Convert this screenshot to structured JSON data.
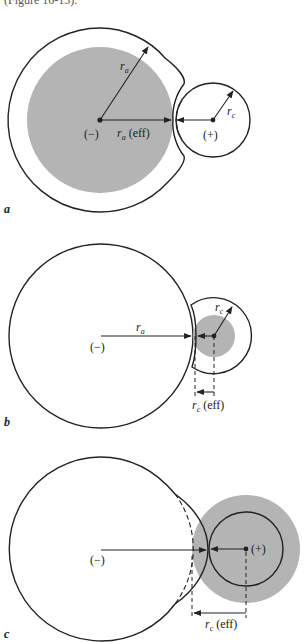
{
  "header": {
    "cut_text": "(Figure 16-13)."
  },
  "colors": {
    "shade": "#b4b4b4",
    "stroke": "#222222",
    "background": "#ffffff"
  },
  "panels": [
    {
      "id": "a",
      "label": "a",
      "anion_sign": "(−)",
      "cation_sign": "(+)",
      "ra_label": "r",
      "ra_sub": "a",
      "ra_eff_label": "r",
      "ra_eff_sub": "a",
      "ra_eff_suffix": "(eff)",
      "rc_label": "r",
      "rc_sub": "c"
    },
    {
      "id": "b",
      "label": "b",
      "anion_sign": "(−)",
      "ra_label": "r",
      "ra_sub": "a",
      "rc_label": "r",
      "rc_sub": "c",
      "rc_eff_label": "r",
      "rc_eff_sub": "c",
      "rc_eff_suffix": "(eff)"
    },
    {
      "id": "c",
      "label": "c",
      "anion_sign": "(−)",
      "cation_sign": "(+)",
      "rc_eff_label": "r",
      "rc_eff_sub": "c",
      "rc_eff_suffix": "(eff)"
    }
  ]
}
